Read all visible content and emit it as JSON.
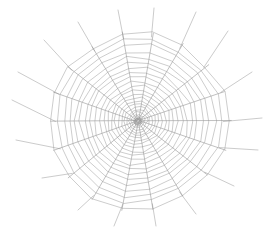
{
  "figure": {
    "background_color": "#ffffff",
    "width": 273,
    "height": 233
  },
  "chart_data": {
    "type": "scatter",
    "xlabel": "",
    "ylabel": "",
    "center": {
      "x": 138,
      "y": 121
    },
    "radial_count": 18,
    "ring_count": 22,
    "inner_radius": 3,
    "outer_radius": 96,
    "radial_angles_deg": [
      0,
      20,
      40,
      60,
      80,
      100,
      120,
      140,
      160,
      180,
      200,
      220,
      240,
      260,
      280,
      300,
      320,
      340
    ],
    "radius_x_per_angle": [
      96,
      97,
      95,
      92,
      90,
      93,
      96,
      97,
      94,
      92,
      93,
      95,
      97,
      95,
      91,
      92,
      95,
      97
    ],
    "radius_y_per_angle": [
      88,
      90,
      91,
      93,
      95,
      94,
      90,
      88,
      87,
      88,
      90,
      92,
      94,
      95,
      93,
      90,
      88,
      87
    ],
    "ring_radii_fraction": [
      0.03,
      0.05,
      0.072,
      0.096,
      0.122,
      0.15,
      0.181,
      0.214,
      0.25,
      0.288,
      0.329,
      0.372,
      0.418,
      0.466,
      0.517,
      0.57,
      0.626,
      0.684,
      0.745,
      0.808,
      0.874,
      0.942
    ],
    "anchor_lines": [
      {
        "angle_deg": 0,
        "extend_to_x": 262,
        "extend_to_y": 118
      },
      {
        "angle_deg": 20,
        "extend_to_x": 252,
        "extend_to_y": 72
      },
      {
        "angle_deg": 40,
        "extend_to_x": 228,
        "extend_to_y": 31
      },
      {
        "angle_deg": 60,
        "extend_to_x": 196,
        "extend_to_y": 12
      },
      {
        "angle_deg": 80,
        "extend_to_x": 154,
        "extend_to_y": 8
      },
      {
        "angle_deg": 100,
        "extend_to_x": 118,
        "extend_to_y": 10
      },
      {
        "angle_deg": 120,
        "extend_to_x": 78,
        "extend_to_y": 22
      },
      {
        "angle_deg": 140,
        "extend_to_x": 44,
        "extend_to_y": 40
      },
      {
        "angle_deg": 160,
        "extend_to_x": 18,
        "extend_to_y": 72
      },
      {
        "angle_deg": 180,
        "extend_to_x": 12,
        "extend_to_y": 100
      },
      {
        "angle_deg": 200,
        "extend_to_x": 16,
        "extend_to_y": 140
      },
      {
        "angle_deg": 220,
        "extend_to_x": 42,
        "extend_to_y": 178
      },
      {
        "angle_deg": 240,
        "extend_to_x": 78,
        "extend_to_y": 210
      },
      {
        "angle_deg": 260,
        "extend_to_x": 114,
        "extend_to_y": 226
      },
      {
        "angle_deg": 280,
        "extend_to_x": 156,
        "extend_to_y": 226
      },
      {
        "angle_deg": 300,
        "extend_to_x": 196,
        "extend_to_y": 214
      },
      {
        "angle_deg": 320,
        "extend_to_x": 234,
        "extend_to_y": 186
      },
      {
        "angle_deg": 340,
        "extend_to_x": 258,
        "extend_to_y": 150
      }
    ],
    "stroke_color_radial": "#8c8c8c",
    "stroke_color_spiral": "#9a9a9a",
    "stroke_color_anchor": "#a8a8a8",
    "stroke_width_radial": 0.55,
    "stroke_width_spiral": 0.5,
    "stroke_width_anchor": 0.6,
    "grid": false,
    "legend": "none"
  }
}
